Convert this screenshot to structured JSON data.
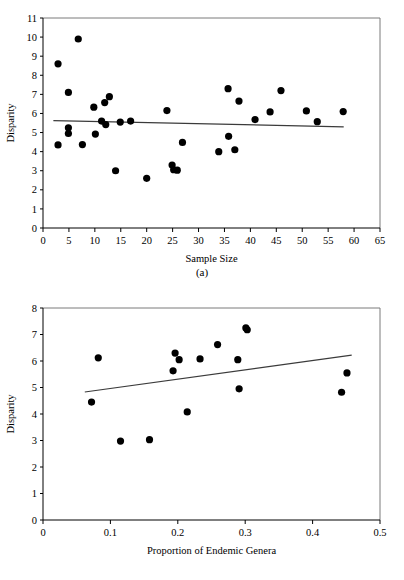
{
  "figure": {
    "background_color": "#ffffff",
    "point_color": "#000000",
    "trend_line_color": "#3b3b3b",
    "frame_color": "#7a7a7a"
  },
  "panel_a": {
    "caption": "(a)",
    "chart_data": {
      "type": "scatter",
      "title": "",
      "xlabel": "Sample Size",
      "ylabel": "Disparity",
      "xlim": [
        0,
        65
      ],
      "ylim": [
        0,
        11
      ],
      "xticks": [
        0,
        5,
        10,
        15,
        20,
        25,
        30,
        35,
        40,
        45,
        50,
        55,
        60,
        65
      ],
      "yticks": [
        0,
        1,
        2,
        3,
        4,
        5,
        6,
        7,
        8,
        9,
        10,
        11
      ],
      "xtick_labels": [
        "0",
        "5",
        "10",
        "15",
        "20",
        "25",
        "30",
        "35",
        "40",
        "45",
        "50",
        "55",
        "60",
        "65"
      ],
      "ytick_labels": [
        "0",
        "1",
        "2",
        "3",
        "4",
        "5",
        "6",
        "7",
        "8",
        "9",
        "10",
        "11"
      ],
      "grid": false,
      "legend": "none",
      "points": [
        {
          "x": 2.9,
          "y": 8.6
        },
        {
          "x": 2.9,
          "y": 4.35
        },
        {
          "x": 4.9,
          "y": 7.1
        },
        {
          "x": 4.9,
          "y": 5.25
        },
        {
          "x": 4.9,
          "y": 4.95
        },
        {
          "x": 6.8,
          "y": 9.9
        },
        {
          "x": 7.6,
          "y": 4.37
        },
        {
          "x": 9.8,
          "y": 6.33
        },
        {
          "x": 10.1,
          "y": 4.92
        },
        {
          "x": 11.3,
          "y": 5.6
        },
        {
          "x": 11.9,
          "y": 6.57
        },
        {
          "x": 12.1,
          "y": 5.42
        },
        {
          "x": 12.8,
          "y": 6.88
        },
        {
          "x": 14.0,
          "y": 3.0
        },
        {
          "x": 14.9,
          "y": 5.55
        },
        {
          "x": 16.9,
          "y": 5.6
        },
        {
          "x": 20.0,
          "y": 2.6
        },
        {
          "x": 23.9,
          "y": 6.15
        },
        {
          "x": 24.9,
          "y": 3.3
        },
        {
          "x": 25.2,
          "y": 3.05
        },
        {
          "x": 25.9,
          "y": 3.03
        },
        {
          "x": 26.9,
          "y": 4.48
        },
        {
          "x": 33.9,
          "y": 4.0
        },
        {
          "x": 35.7,
          "y": 7.3
        },
        {
          "x": 35.8,
          "y": 4.8
        },
        {
          "x": 37.0,
          "y": 4.1
        },
        {
          "x": 37.8,
          "y": 6.65
        },
        {
          "x": 40.9,
          "y": 5.68
        },
        {
          "x": 43.8,
          "y": 6.08
        },
        {
          "x": 45.9,
          "y": 7.2
        },
        {
          "x": 50.8,
          "y": 6.13
        },
        {
          "x": 52.9,
          "y": 5.57
        },
        {
          "x": 57.9,
          "y": 6.1
        }
      ],
      "trend_line": {
        "x1": 2.0,
        "y1": 5.62,
        "x2": 58.0,
        "y2": 5.3
      }
    }
  },
  "panel_b": {
    "caption": "(b)",
    "chart_data": {
      "type": "scatter",
      "title": "",
      "xlabel": "Proportion of Endemic Genera",
      "ylabel": "Disparity",
      "xlim": [
        0,
        0.5
      ],
      "ylim": [
        0,
        8
      ],
      "xticks": [
        0,
        0.1,
        0.2,
        0.3,
        0.4,
        0.5
      ],
      "yticks": [
        0,
        1,
        2,
        3,
        4,
        5,
        6,
        7,
        8
      ],
      "xtick_labels": [
        "0",
        "0.1",
        "0.2",
        "0.3",
        "0.4",
        "0.5"
      ],
      "ytick_labels": [
        "0",
        "1",
        "2",
        "3",
        "4",
        "5",
        "6",
        "7",
        "8"
      ],
      "grid": false,
      "legend": "none",
      "points": [
        {
          "x": 0.072,
          "y": 4.45
        },
        {
          "x": 0.082,
          "y": 6.12
        },
        {
          "x": 0.115,
          "y": 2.98
        },
        {
          "x": 0.158,
          "y": 3.03
        },
        {
          "x": 0.193,
          "y": 5.63
        },
        {
          "x": 0.196,
          "y": 6.3
        },
        {
          "x": 0.202,
          "y": 6.05
        },
        {
          "x": 0.214,
          "y": 4.08
        },
        {
          "x": 0.233,
          "y": 6.08
        },
        {
          "x": 0.259,
          "y": 6.62
        },
        {
          "x": 0.289,
          "y": 6.05
        },
        {
          "x": 0.291,
          "y": 4.95
        },
        {
          "x": 0.301,
          "y": 7.25
        },
        {
          "x": 0.303,
          "y": 7.18
        },
        {
          "x": 0.443,
          "y": 4.82
        },
        {
          "x": 0.451,
          "y": 5.55
        }
      ],
      "trend_line": {
        "x1": 0.062,
        "y1": 4.83,
        "x2": 0.458,
        "y2": 6.22
      }
    }
  }
}
